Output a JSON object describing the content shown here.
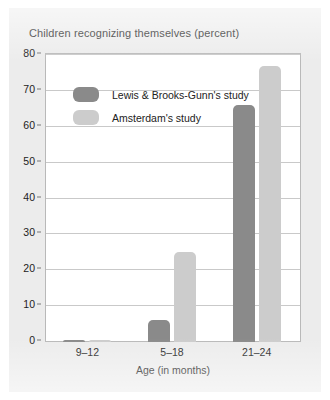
{
  "chart_data": {
    "type": "bar",
    "title": "Children recognizing themselves (percent)",
    "xlabel": "Age (in months)",
    "ylabel": "",
    "categories": [
      "9–12",
      "5–18",
      "21–24"
    ],
    "series": [
      {
        "name": "Lewis & Brooks-Gunn's study",
        "color": "#8a8a8a",
        "values": [
          0.5,
          6,
          66
        ]
      },
      {
        "name": "Amsterdam's study",
        "color": "#cccccc",
        "values": [
          0.5,
          25,
          77
        ]
      }
    ],
    "ylim": [
      0,
      80
    ],
    "yticks": [
      0,
      10,
      20,
      30,
      40,
      50,
      60,
      70,
      80
    ],
    "ytick_labels": [
      "0",
      "10",
      "20",
      "30",
      "40",
      "50",
      "60",
      "70",
      "80"
    ],
    "grid": true,
    "legend_position": "inside-top-left"
  },
  "figure": {
    "background_color": "#ececec",
    "plot_background_color": "#ffffff",
    "border_color": "#b9b9b9",
    "gridline_color": "#c9c9c9"
  }
}
